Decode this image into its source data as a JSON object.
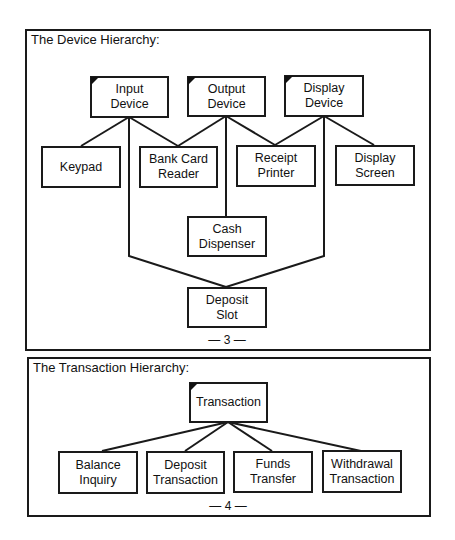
{
  "device_hierarchy": {
    "title": "The Device Hierarchy:",
    "page_label": "— 3 —",
    "nodes": {
      "input_device": "Input\nDevice",
      "output_device": "Output\nDevice",
      "display_device": "Display\nDevice",
      "keypad": "Keypad",
      "bank_card_reader": "Bank Card\nReader",
      "receipt_printer": "Receipt\nPrinter",
      "display_screen": "Display\nScreen",
      "cash_dispenser": "Cash\nDispenser",
      "deposit_slot": "Deposit\nSlot"
    },
    "edges": [
      [
        "Input Device",
        "Keypad"
      ],
      [
        "Input Device",
        "Bank Card Reader"
      ],
      [
        "Input Device",
        "Deposit Slot"
      ],
      [
        "Output Device",
        "Bank Card Reader"
      ],
      [
        "Output Device",
        "Receipt Printer"
      ],
      [
        "Output Device",
        "Cash Dispenser"
      ],
      [
        "Display Device",
        "Receipt Printer"
      ],
      [
        "Display Device",
        "Display Screen"
      ],
      [
        "Display Device",
        "Deposit Slot"
      ]
    ],
    "abstract_classes": [
      "Input Device",
      "Output Device",
      "Display Device"
    ]
  },
  "transaction_hierarchy": {
    "title": "The Transaction Hierarchy:",
    "page_label": "— 4 —",
    "nodes": {
      "transaction": "Transaction",
      "balance_inquiry": "Balance\nInquiry",
      "deposit_transaction": "Deposit\nTransaction",
      "funds_transfer": "Funds\nTransfer",
      "withdrawal_transaction": "Withdrawal\nTransaction"
    },
    "edges": [
      [
        "Transaction",
        "Balance Inquiry"
      ],
      [
        "Transaction",
        "Deposit Transaction"
      ],
      [
        "Transaction",
        "Funds Transfer"
      ],
      [
        "Transaction",
        "Withdrawal Transaction"
      ]
    ],
    "abstract_classes": [
      "Transaction"
    ]
  },
  "colors": {
    "line": "#1a1a1a",
    "background": "#ffffff"
  }
}
